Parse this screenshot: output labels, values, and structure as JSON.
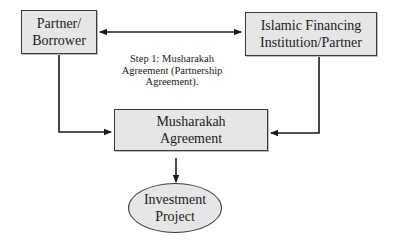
{
  "diagram": {
    "type": "flowchart",
    "nodes": {
      "partner_borrower": {
        "lines": [
          "Partner/",
          "Borrower"
        ],
        "shape": "rectangle"
      },
      "islamic_financing": {
        "lines": [
          "Islamic Financing",
          "Institution/Partner"
        ],
        "shape": "rectangle"
      },
      "musharakah_agreement": {
        "lines": [
          "Musharakah",
          "Agreement"
        ],
        "shape": "rectangle"
      },
      "investment_project": {
        "lines": [
          "Investment",
          "Project"
        ],
        "shape": "ellipse"
      }
    },
    "step_label": {
      "lines": [
        "Step 1: Musharakah",
        "Agreement (Partnership",
        "Agreement)."
      ]
    },
    "edges": [
      {
        "from": "partner_borrower",
        "to": "islamic_financing",
        "direction": "bidirectional"
      },
      {
        "from": "partner_borrower",
        "to": "musharakah_agreement",
        "direction": "forward"
      },
      {
        "from": "islamic_financing",
        "to": "musharakah_agreement",
        "direction": "forward"
      },
      {
        "from": "musharakah_agreement",
        "to": "investment_project",
        "direction": "forward"
      }
    ],
    "colors": {
      "box_fill": "#e6e6e6",
      "stroke": "#1a1a1a",
      "background": "#ffffff"
    }
  }
}
